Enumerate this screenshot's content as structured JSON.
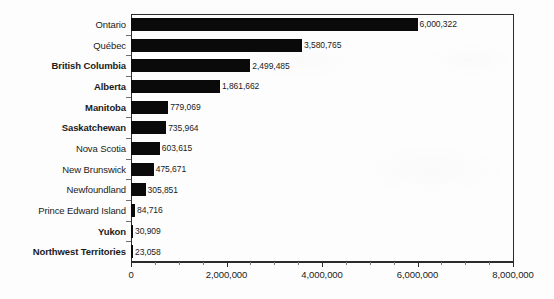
{
  "chart_data": {
    "type": "bar",
    "orientation": "horizontal",
    "title": "",
    "subtitle": "",
    "xlabel": "",
    "ylabel": "",
    "xlim": [
      0,
      8000000
    ],
    "grid": false,
    "legend": null,
    "bar_color": "#0a0a0a",
    "axis_color": "#2b2b2b",
    "xticks": [
      {
        "value": 0,
        "label": "0"
      },
      {
        "value": 2000000,
        "label": "2,000,000"
      },
      {
        "value": 4000000,
        "label": "4,000,000"
      },
      {
        "value": 6000000,
        "label": "6,000,000"
      },
      {
        "value": 8000000,
        "label": "8,000,000"
      }
    ],
    "x_minor_tick_interval": 500000,
    "categories": [
      "Ontario",
      "Québec",
      "British Columbia",
      "Alberta",
      "Manitoba",
      "Saskatchewan",
      "Nova Scotia",
      "New Brunswick",
      "Newfoundland",
      "Prince Edward Island",
      "Yukon",
      "Northwest Territories"
    ],
    "values": [
      6000322,
      3580765,
      2499485,
      1861662,
      779069,
      735964,
      603615,
      475671,
      305851,
      84716,
      30909,
      23058
    ],
    "value_labels": [
      "6,000,322",
      "3,580,765",
      "2,499,485",
      "1,861,662",
      "779,069",
      "735,964",
      "603,615",
      "475,671",
      "305,851",
      "84,716",
      "30,909",
      "23,058"
    ],
    "category_label_bold": [
      false,
      false,
      true,
      true,
      true,
      true,
      false,
      false,
      false,
      false,
      true,
      true
    ]
  }
}
